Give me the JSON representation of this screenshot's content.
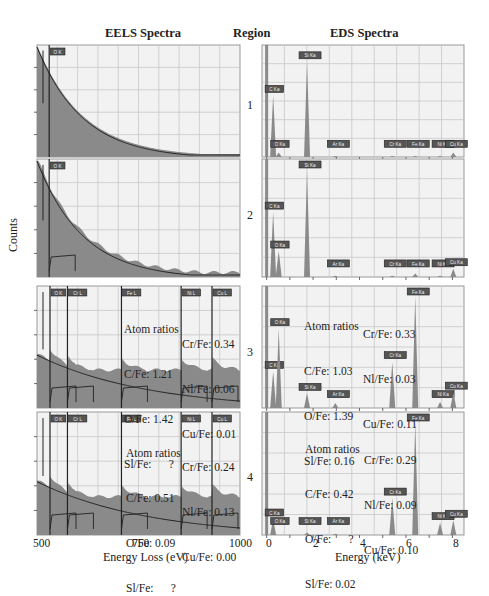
{
  "headers": {
    "eels": "EELS Spectra",
    "region": "Region",
    "eds": "EDS Spectra"
  },
  "y_axis_label": "Counts",
  "eels_axis": {
    "label": "Energy Loss (eV)",
    "ticks": [
      "500",
      "750",
      "1000"
    ]
  },
  "eds_axis": {
    "label": "Energy (keV)",
    "ticks": [
      "0",
      "2",
      "4",
      "6",
      "8"
    ]
  },
  "regions": [
    "1",
    "2",
    "3",
    "4"
  ],
  "colors": {
    "fill": "#8a8a8a",
    "grid": "#c8c8c8",
    "plot_bg": "#f2f2f2",
    "edge_line": "#222222",
    "label_box": "#555555"
  },
  "ratios": {
    "eels3": {
      "title": "Atom ratios",
      "left": [
        "C/Fe: 1.21",
        "O/Fe: 1.42",
        "Sl/Fe:      ?"
      ],
      "right": [
        "Cr/Fe: 0.34",
        "Nl/Fe: 0.06",
        "Cu/Fe: 0.01"
      ]
    },
    "eels4": {
      "title": "Atom ratios",
      "left": [
        "C/Fe: 0.51",
        "O/Fe: 0.09",
        "Sl/Fe:      ?"
      ],
      "right": [
        "Cr/Fe: 0.24",
        "Nl/Fe: 0.13",
        "Cu/Fe: 0.00"
      ]
    },
    "eds3": {
      "title": "Atom ratios",
      "left": [
        "C/Fe: 1.03",
        "O/Fe: 1.39",
        "Sl/Fe: 0.16"
      ],
      "right": [
        "Cr/Fe: 0.33",
        "Nl/Fe: 0.03",
        "Cu/Fe: 0.11"
      ]
    },
    "eds4": {
      "title": "Atom ratios",
      "left": [
        "C/Fe: 0.42",
        "O/Fe:      ?",
        "Sl/Fe: 0.02"
      ],
      "right": [
        "Cr/Fe: 0.29",
        "Nl/Fe: 0.09",
        "Cu/Fe: 0.10"
      ]
    }
  },
  "chart_data": [
    {
      "type": "area",
      "title": "EELS Spectra",
      "xlabel": "Energy Loss (eV)",
      "ylabel": "Counts",
      "xlim": [
        500,
        1000
      ],
      "grid": true,
      "panels": [
        {
          "region": "1",
          "edges": [
            {
              "label": "O K",
              "x": 530
            }
          ],
          "background_decay": "exponential",
          "signal": "smooth decay, no visible edges beyond O K"
        },
        {
          "region": "2",
          "edges": [
            {
              "label": "O K",
              "x": 530
            }
          ],
          "background_decay": "exponential",
          "signal": "noisy decay with small O K edge"
        },
        {
          "region": "3",
          "edges": [
            {
              "label": "O K",
              "x": 532
            },
            {
              "label": "Cr L",
              "x": 575
            },
            {
              "label": "Fe L",
              "x": 708
            },
            {
              "label": "Ni L",
              "x": 855
            },
            {
              "label": "Cu L",
              "x": 931
            }
          ]
        },
        {
          "region": "4",
          "edges": [
            {
              "label": "O K",
              "x": 532
            },
            {
              "label": "Cr L",
              "x": 575
            },
            {
              "label": "Fe L",
              "x": 708
            },
            {
              "label": "Ni L",
              "x": 855
            },
            {
              "label": "Cu L",
              "x": 931
            }
          ]
        }
      ]
    },
    {
      "type": "bar",
      "title": "EDS Spectra",
      "xlabel": "Energy (keV)",
      "ylabel": "Counts",
      "xlim": [
        -0.2,
        8.5
      ],
      "grid": true,
      "panels": [
        {
          "region": "1",
          "peaks": [
            {
              "label": "C Ka",
              "x": 0.28,
              "h": 0.55
            },
            {
              "label": "O Ka",
              "x": 0.52,
              "h": 0.04
            },
            {
              "label": "Si Ka",
              "x": 1.74,
              "h": 0.85
            },
            {
              "label": "Ar Ka",
              "x": 2.96,
              "h": 0.01
            },
            {
              "label": "Cr Ka",
              "x": 5.41,
              "h": 0.01
            },
            {
              "label": "Fe Ka",
              "x": 6.4,
              "h": 0.01
            },
            {
              "label": "Ni Ka",
              "x": 7.47,
              "h": 0.01
            },
            {
              "label": "Cu Ka",
              "x": 8.04,
              "h": 0.04
            }
          ]
        },
        {
          "region": "2",
          "peaks": [
            {
              "label": "C Ka",
              "x": 0.28,
              "h": 0.55
            },
            {
              "label": "O Ka",
              "x": 0.52,
              "h": 0.22
            },
            {
              "label": "Si Ka",
              "x": 1.74,
              "h": 0.9
            },
            {
              "label": "Ar Ka",
              "x": 2.96,
              "h": 0.01
            },
            {
              "label": "Cr Ka",
              "x": 5.41,
              "h": 0.01
            },
            {
              "label": "Fe Ka",
              "x": 6.4,
              "h": 0.03
            },
            {
              "label": "Ni Ka",
              "x": 7.47,
              "h": 0.01
            },
            {
              "label": "Cu Ka",
              "x": 8.04,
              "h": 0.07
            }
          ]
        },
        {
          "region": "3",
          "peaks": [
            {
              "label": "C Ka",
              "x": 0.28,
              "h": 0.3
            },
            {
              "label": "O Ka",
              "x": 0.52,
              "h": 0.65
            },
            {
              "label": "Si Ka",
              "x": 1.74,
              "h": 0.12
            },
            {
              "label": "Ar Ka",
              "x": 2.96,
              "h": 0.04
            },
            {
              "label": "Cr Ka",
              "x": 5.41,
              "h": 0.38
            },
            {
              "label": "Fe Ka",
              "x": 6.4,
              "h": 0.92
            },
            {
              "label": "Ni Ka",
              "x": 7.47,
              "h": 0.05
            },
            {
              "label": "Cu Ka",
              "x": 8.04,
              "h": 0.13
            }
          ]
        },
        {
          "region": "4",
          "peaks": [
            {
              "label": "C Ka",
              "x": 0.28,
              "h": 0.13
            },
            {
              "label": "O Ka",
              "x": 0.52,
              "h": 0.0
            },
            {
              "label": "Si Ka",
              "x": 1.74,
              "h": 0.02
            },
            {
              "label": "Ar Ka",
              "x": 2.96,
              "h": 0.01
            },
            {
              "label": "Cr Ka",
              "x": 5.41,
              "h": 0.3
            },
            {
              "label": "Fe Ka",
              "x": 6.4,
              "h": 0.92
            },
            {
              "label": "Ni Ka",
              "x": 7.47,
              "h": 0.1
            },
            {
              "label": "Cu Ka",
              "x": 8.04,
              "h": 0.12
            }
          ]
        }
      ]
    }
  ]
}
